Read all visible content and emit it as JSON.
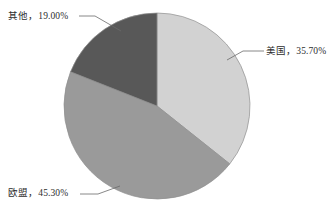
{
  "chart_data": {
    "type": "pie",
    "title": "",
    "categories": [
      "美国",
      "欧盟",
      "其他"
    ],
    "values": [
      35.7,
      45.3,
      19.0
    ],
    "value_suffix": "%",
    "labels": [
      {
        "name": "美国",
        "value": 35.7,
        "text": "美国，35.70%",
        "position": "right",
        "color": "#d2d2d2"
      },
      {
        "name": "欧盟",
        "value": 45.3,
        "text": "欧盟，45.30%",
        "position": "bottom-left",
        "color": "#9a9a9a"
      },
      {
        "name": "其他",
        "value": 19.0,
        "text": "其他，19.00%",
        "position": "top-left",
        "color": "#585858"
      }
    ],
    "legend": "none",
    "grid": false,
    "start_angle_deg": 0,
    "direction": "clockwise",
    "xlabel": "",
    "ylabel": ""
  },
  "colors": {
    "slice_us": "#d2d2d2",
    "slice_eu": "#9a9a9a",
    "slice_other": "#585858",
    "outline": "#8a8a8a",
    "leader_line": "#6a6a6a",
    "text": "#2e2e2e",
    "background": "#ffffff"
  },
  "labels": {
    "other": "其他，19.00%",
    "us": "美国，35.70%",
    "eu": "欧盟，45.30%"
  }
}
